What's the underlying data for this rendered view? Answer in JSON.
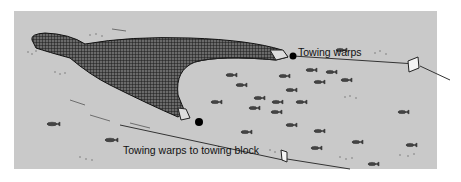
{
  "diagram": {
    "type": "illustration",
    "labels": {
      "top_warp": "Towing warps",
      "bottom_warp": "Towing warps to towing block"
    },
    "colors": {
      "background": "#c9c9c9",
      "net": "#2a2a2a",
      "line": "#333333",
      "text": "#111111"
    }
  }
}
